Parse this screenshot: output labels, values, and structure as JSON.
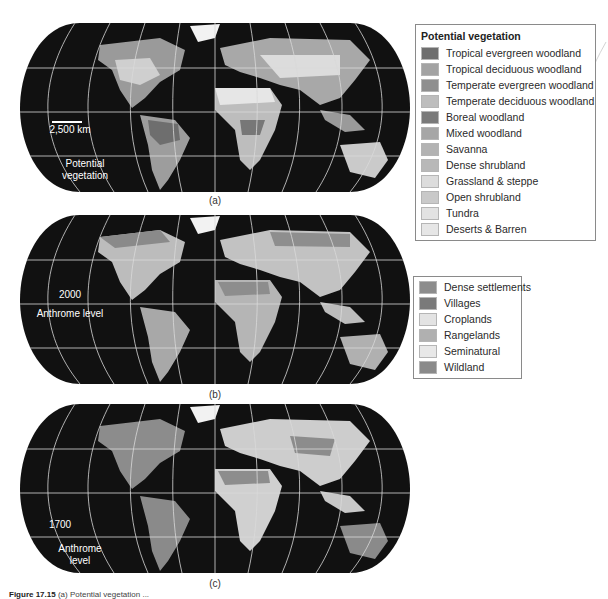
{
  "figure": {
    "caption_number": "Figure 17.15",
    "caption_text": "(a) Potential vegetation ..."
  },
  "maps": [
    {
      "id": "a",
      "panel_label": "(a)",
      "overlay_text": [
        "Potential",
        "vegetation"
      ],
      "scale_bar_label": "2,500 km"
    },
    {
      "id": "b",
      "panel_label": "(b)",
      "overlay_text": [
        "2000",
        "Anthrome level"
      ]
    },
    {
      "id": "c",
      "panel_label": "(c)",
      "overlay_text": [
        "1700",
        "Anthrome",
        "level"
      ]
    }
  ],
  "legend_vegetation": {
    "title": "Potential vegetation",
    "items": [
      {
        "label": "Tropical evergreen woodland",
        "color": "#6e6e6e"
      },
      {
        "label": "Tropical deciduous woodland",
        "color": "#a3a3a3"
      },
      {
        "label": "Temperate evergreen woodland",
        "color": "#8f8f8f"
      },
      {
        "label": "Temperate deciduous woodland",
        "color": "#bdbdbd"
      },
      {
        "label": "Boreal woodland",
        "color": "#7a7a7a"
      },
      {
        "label": "Mixed woodland",
        "color": "#a6a6a6"
      },
      {
        "label": "Savanna",
        "color": "#b3b3b3"
      },
      {
        "label": "Dense shrubland",
        "color": "#b8b8b8"
      },
      {
        "label": "Grassland & steppe",
        "color": "#dcdcdc"
      },
      {
        "label": "Open shrubland",
        "color": "#c9c9c9"
      },
      {
        "label": "Tundra",
        "color": "#e2e2e2"
      },
      {
        "label": "Deserts & Barren",
        "color": "#e6e6e6"
      }
    ]
  },
  "legend_anthrome": {
    "items": [
      {
        "label": "Dense settlements",
        "color": "#8c8c8c"
      },
      {
        "label": "Villages",
        "color": "#7a7a7a"
      },
      {
        "label": "Croplands",
        "color": "#e3e3e3"
      },
      {
        "label": "Rangelands",
        "color": "#b0b0b0"
      },
      {
        "label": "Seminatural",
        "color": "#e8e8e8"
      },
      {
        "label": "Wildland",
        "color": "#8a8a8a"
      }
    ]
  },
  "colors": {
    "ocean": "#111111",
    "graticule": "#d9d9d9"
  }
}
